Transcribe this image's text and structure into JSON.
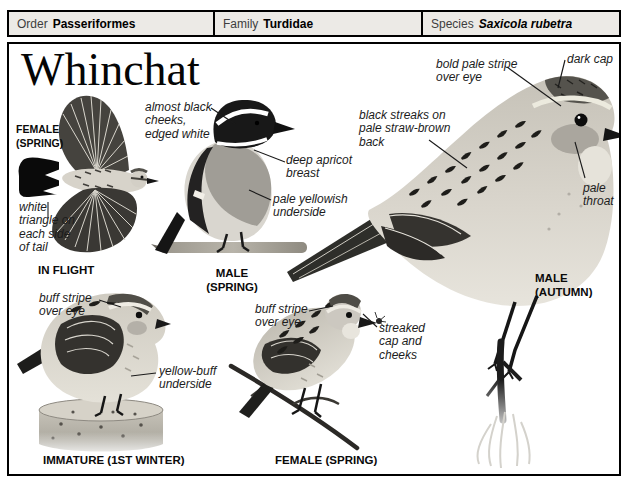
{
  "taxonomy": {
    "order_label": "Order",
    "order_value": "Passeriformes",
    "family_label": "Family",
    "family_value": "Turdidae",
    "species_label": "Species",
    "species_value": "Saxicola rubetra"
  },
  "title": "Whinchat",
  "figures": {
    "in_flight": {
      "sex_label": "FEMALE (SPRING)",
      "caption": "IN FLIGHT",
      "annotations": [
        "white triangle on each side of tail"
      ]
    },
    "male_spring": {
      "caption": "MALE (SPRING)",
      "annotations": [
        "almost black cheeks, edged white",
        "deep apricot breast",
        "pale yellowish underside"
      ]
    },
    "male_autumn": {
      "caption": "MALE (AUTUMN)",
      "annotations": [
        "bold pale stripe over eye",
        "dark cap",
        "black streaks on pale straw-brown back",
        "pale throat"
      ]
    },
    "immature": {
      "caption": "IMMATURE (1ST WINTER)",
      "annotations": [
        "buff stripe over eye",
        "yellow-buff underside"
      ]
    },
    "female_spring": {
      "caption": "FEMALE (SPRING)",
      "annotations": [
        "buff stripe over eye",
        "streaked cap and cheeks"
      ]
    }
  },
  "colors": {
    "ink": "#000000",
    "taxbar_bg": "#eceae6",
    "annotation_text": "#1c1c1c"
  }
}
